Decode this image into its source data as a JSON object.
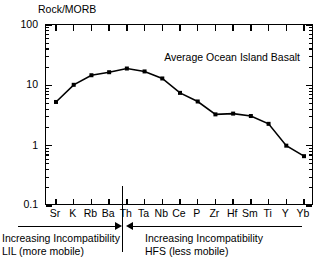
{
  "chart_data": {
    "type": "line",
    "title": "Average Ocean Island Basalt",
    "ylabel": "Rock/MORB",
    "xlabel": "",
    "yscale": "log",
    "ylim": [
      0.1,
      100
    ],
    "ytick_labels": [
      "100",
      "10",
      "1",
      "0.1"
    ],
    "ytick_values": [
      100,
      10,
      1,
      0.1
    ],
    "grid": false,
    "legend_position": "inside-top-right",
    "categories": [
      "Sr",
      "K",
      "Rb",
      "Ba",
      "Th",
      "Ta",
      "Nb",
      "Ce",
      "P",
      "Zr",
      "Hf",
      "Sm",
      "Ti",
      "Y",
      "Yb"
    ],
    "values": [
      5.3,
      10.2,
      14.7,
      16.5,
      19.0,
      17.0,
      13.0,
      7.5,
      5.4,
      3.3,
      3.4,
      3.1,
      2.3,
      1.0,
      0.67
    ],
    "marker": "square",
    "line_color": "#000000",
    "annotations": {
      "divider_after_category": "Ba",
      "left": {
        "arrow_direction": "right",
        "line1": "Increasing Incompatibility",
        "line2": "LIL (more mobile)"
      },
      "right": {
        "arrow_direction": "left",
        "line1": "Increasing Incompatibility",
        "line2": "HFS (less mobile)"
      }
    }
  }
}
